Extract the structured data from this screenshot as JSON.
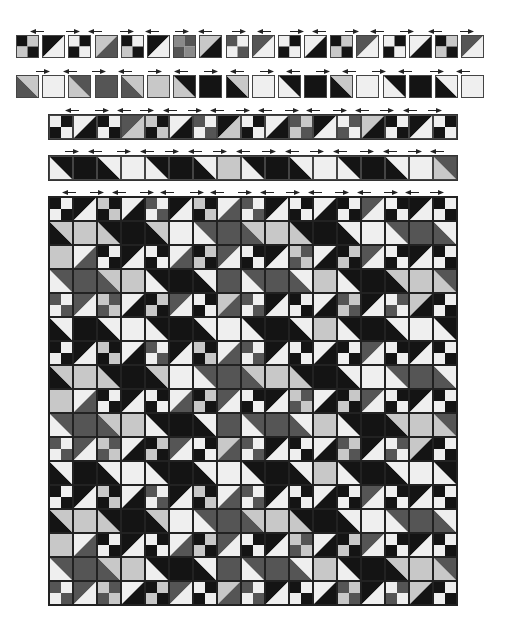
{
  "palette": {
    "K": "#141414",
    "D": "#555555",
    "M": "#8a8a8a",
    "L": "#c8c8c8",
    "W": "#efefef"
  },
  "row1": {
    "tiles": [
      {
        "t": "4p",
        "c": [
          "K",
          "L",
          "L",
          "K"
        ]
      },
      {
        "t": "ta",
        "c": [
          "K",
          "W"
        ]
      },
      {
        "t": "4p",
        "c": [
          "W",
          "K",
          "K",
          "W"
        ]
      },
      {
        "t": "ta",
        "c": [
          "L",
          "D"
        ]
      },
      {
        "t": "4p",
        "c": [
          "K",
          "W",
          "L",
          "K"
        ]
      },
      {
        "t": "ta",
        "c": [
          "K",
          "W"
        ]
      },
      {
        "t": "4p",
        "c": [
          "M",
          "D",
          "D",
          "M"
        ]
      },
      {
        "t": "ta",
        "c": [
          "L",
          "K"
        ]
      },
      {
        "t": "4p",
        "c": [
          "D",
          "W",
          "W",
          "D"
        ]
      },
      {
        "t": "ta",
        "c": [
          "D",
          "W"
        ]
      },
      {
        "t": "4p",
        "c": [
          "W",
          "K",
          "K",
          "W"
        ]
      },
      {
        "t": "ta",
        "c": [
          "W",
          "K"
        ]
      },
      {
        "t": "4p",
        "c": [
          "K",
          "L",
          "L",
          "K"
        ]
      },
      {
        "t": "ta",
        "c": [
          "D",
          "W"
        ]
      },
      {
        "t": "4p",
        "c": [
          "W",
          "K",
          "K",
          "W"
        ]
      },
      {
        "t": "ta",
        "c": [
          "W",
          "K"
        ]
      },
      {
        "t": "4p",
        "c": [
          "K",
          "L",
          "L",
          "K"
        ]
      },
      {
        "t": "ta",
        "c": [
          "D",
          "W"
        ]
      }
    ]
  },
  "row2": {
    "tiles": [
      {
        "t": "tb",
        "c": [
          "D",
          "L"
        ]
      },
      {
        "t": "s",
        "c": [
          "W"
        ]
      },
      {
        "t": "tb",
        "c": [
          "L",
          "D"
        ]
      },
      {
        "t": "s",
        "c": [
          "D"
        ]
      },
      {
        "t": "tb",
        "c": [
          "D",
          "L"
        ]
      },
      {
        "t": "s",
        "c": [
          "L"
        ]
      },
      {
        "t": "tb",
        "c": [
          "L",
          "K"
        ]
      },
      {
        "t": "s",
        "c": [
          "K"
        ]
      },
      {
        "t": "tb",
        "c": [
          "K",
          "L"
        ]
      },
      {
        "t": "s",
        "c": [
          "W"
        ]
      },
      {
        "t": "tb",
        "c": [
          "W",
          "K"
        ]
      },
      {
        "t": "s",
        "c": [
          "K"
        ]
      },
      {
        "t": "tb",
        "c": [
          "K",
          "L"
        ]
      },
      {
        "t": "s",
        "c": [
          "W"
        ]
      },
      {
        "t": "tb",
        "c": [
          "W",
          "K"
        ]
      },
      {
        "t": "s",
        "c": [
          "K"
        ]
      },
      {
        "t": "tb",
        "c": [
          "K",
          "W"
        ]
      },
      {
        "t": "s",
        "c": [
          "W"
        ]
      }
    ]
  },
  "row3": {
    "tiles": [
      {
        "t": "4p",
        "c": [
          "W",
          "K",
          "K",
          "W"
        ]
      },
      {
        "t": "ta",
        "c": [
          "W",
          "K"
        ]
      },
      {
        "t": "4p",
        "c": [
          "K",
          "W",
          "W",
          "K"
        ]
      },
      {
        "t": "ta",
        "c": [
          "D",
          "L"
        ]
      },
      {
        "t": "4p",
        "c": [
          "L",
          "K",
          "K",
          "L"
        ]
      },
      {
        "t": "ta",
        "c": [
          "W",
          "K"
        ]
      },
      {
        "t": "4p",
        "c": [
          "D",
          "W",
          "W",
          "D"
        ]
      },
      {
        "t": "ta",
        "c": [
          "K",
          "L"
        ]
      },
      {
        "t": "4p",
        "c": [
          "W",
          "K",
          "K",
          "W"
        ]
      },
      {
        "t": "ta",
        "c": [
          "W",
          "K"
        ]
      },
      {
        "t": "4p",
        "c": [
          "D",
          "L",
          "L",
          "D"
        ]
      },
      {
        "t": "ta",
        "c": [
          "K",
          "W"
        ]
      },
      {
        "t": "4p",
        "c": [
          "W",
          "D",
          "D",
          "W"
        ]
      },
      {
        "t": "ta",
        "c": [
          "L",
          "K"
        ]
      },
      {
        "t": "4p",
        "c": [
          "K",
          "W",
          "W",
          "K"
        ]
      },
      {
        "t": "ta",
        "c": [
          "K",
          "W"
        ]
      },
      {
        "t": "4p",
        "c": [
          "W",
          "K",
          "K",
          "W"
        ]
      }
    ]
  },
  "row4": {
    "tiles": [
      {
        "t": "tb",
        "c": [
          "W",
          "K"
        ]
      },
      {
        "t": "s",
        "c": [
          "K"
        ]
      },
      {
        "t": "tb",
        "c": [
          "K",
          "W"
        ]
      },
      {
        "t": "s",
        "c": [
          "W"
        ]
      },
      {
        "t": "tb",
        "c": [
          "W",
          "K"
        ]
      },
      {
        "t": "s",
        "c": [
          "K"
        ]
      },
      {
        "t": "tb",
        "c": [
          "K",
          "W"
        ]
      },
      {
        "t": "s",
        "c": [
          "L"
        ]
      },
      {
        "t": "tb",
        "c": [
          "W",
          "K"
        ]
      },
      {
        "t": "s",
        "c": [
          "K"
        ]
      },
      {
        "t": "tb",
        "c": [
          "K",
          "W"
        ]
      },
      {
        "t": "s",
        "c": [
          "W"
        ]
      },
      {
        "t": "tb",
        "c": [
          "W",
          "K"
        ]
      },
      {
        "t": "s",
        "c": [
          "K"
        ]
      },
      {
        "t": "tb",
        "c": [
          "K",
          "W"
        ]
      },
      {
        "t": "s",
        "c": [
          "W"
        ]
      },
      {
        "t": "tb",
        "c": [
          "L",
          "D"
        ]
      }
    ]
  },
  "quilt": {
    "cols": 17,
    "rows": 17,
    "tile_size": 24,
    "odd_row_patterns": [
      [
        [
          "K",
          "W",
          "W",
          "K"
        ],
        [
          "K",
          "W"
        ],
        [
          "L",
          "K",
          "K",
          "L"
        ],
        [
          "W",
          "K"
        ],
        [
          "D",
          "W",
          "W",
          "D"
        ],
        [
          "K",
          "W"
        ],
        [
          "L",
          "K",
          "K",
          "L"
        ],
        [
          "W",
          "D"
        ],
        [
          "D",
          "W",
          "W",
          "D"
        ],
        [
          "K",
          "W"
        ],
        [
          "W",
          "K",
          "K",
          "W"
        ],
        [
          "W",
          "K"
        ],
        [
          "K",
          "W",
          "W",
          "K"
        ],
        [
          "D",
          "W"
        ],
        [
          "W",
          "K",
          "K",
          "W"
        ],
        [
          "K",
          "W"
        ],
        [
          "K",
          "W",
          "W",
          "K"
        ]
      ],
      [
        [
          "L",
          "L",
          "L",
          "L"
        ],
        [
          "W",
          "D"
        ],
        [
          "K",
          "W",
          "W",
          "K"
        ],
        [
          "K",
          "W"
        ],
        [
          "W",
          "K",
          "K",
          "W"
        ],
        [
          "W",
          "D"
        ],
        [
          "K",
          "L",
          "L",
          "K"
        ],
        [
          "D",
          "W"
        ],
        [
          "W",
          "K",
          "K",
          "W"
        ],
        [
          "K",
          "W"
        ],
        [
          "L",
          "D",
          "D",
          "L"
        ],
        [
          "W",
          "K"
        ],
        [
          "K",
          "L",
          "L",
          "K"
        ],
        [
          "D",
          "W"
        ],
        [
          "W",
          "K",
          "K",
          "W"
        ],
        [
          "K",
          "W"
        ],
        [
          "K",
          "W",
          "W",
          "K"
        ]
      ],
      [
        [
          "D",
          "W",
          "W",
          "D"
        ],
        [
          "D",
          "W"
        ],
        [
          "L",
          "D",
          "D",
          "L"
        ],
        [
          "W",
          "K"
        ],
        [
          "K",
          "L",
          "L",
          "K"
        ],
        [
          "D",
          "W"
        ],
        [
          "W",
          "K",
          "K",
          "W"
        ],
        [
          "L",
          "D"
        ],
        [
          "D",
          "W",
          "W",
          "D"
        ],
        [
          "K",
          "W"
        ],
        [
          "K",
          "W",
          "W",
          "K"
        ],
        [
          "W",
          "K"
        ],
        [
          "D",
          "L",
          "L",
          "D"
        ],
        [
          "K",
          "W"
        ],
        [
          "W",
          "D",
          "D",
          "W"
        ],
        [
          "L",
          "K"
        ],
        [
          "K",
          "W",
          "W",
          "K"
        ]
      ]
    ],
    "even_row_patterns": [
      [
        [
          "tb",
          "K",
          "L"
        ],
        [
          "s",
          "L"
        ],
        [
          "tb",
          "L",
          "K"
        ],
        [
          "s",
          "K"
        ],
        [
          "tb",
          "K",
          "L"
        ],
        [
          "s",
          "W"
        ],
        [
          "tb",
          "W",
          "D"
        ],
        [
          "s",
          "D"
        ],
        [
          "tb",
          "D",
          "L"
        ],
        [
          "s",
          "L"
        ],
        [
          "tb",
          "L",
          "K"
        ],
        [
          "s",
          "K"
        ],
        [
          "tb",
          "K",
          "W"
        ],
        [
          "s",
          "W"
        ],
        [
          "tb",
          "W",
          "D"
        ],
        [
          "s",
          "D"
        ],
        [
          "tb",
          "D",
          "W"
        ]
      ],
      [
        [
          "tb",
          "W",
          "D"
        ],
        [
          "s",
          "D"
        ],
        [
          "tb",
          "D",
          "L"
        ],
        [
          "s",
          "L"
        ],
        [
          "tb",
          "W",
          "K"
        ],
        [
          "s",
          "K"
        ],
        [
          "tb",
          "K",
          "W"
        ],
        [
          "s",
          "D"
        ],
        [
          "tb",
          "W",
          "D"
        ],
        [
          "s",
          "D"
        ],
        [
          "tb",
          "D",
          "W"
        ],
        [
          "s",
          "L"
        ],
        [
          "tb",
          "W",
          "K"
        ],
        [
          "s",
          "K"
        ],
        [
          "tb",
          "K",
          "L"
        ],
        [
          "s",
          "L"
        ],
        [
          "tb",
          "L",
          "D"
        ]
      ],
      [
        [
          "tb",
          "K",
          "W"
        ],
        [
          "s",
          "K"
        ],
        [
          "tb",
          "K",
          "W"
        ],
        [
          "s",
          "W"
        ],
        [
          "tb",
          "W",
          "K"
        ],
        [
          "s",
          "K"
        ],
        [
          "tb",
          "K",
          "W"
        ],
        [
          "s",
          "W"
        ],
        [
          "tb",
          "W",
          "K"
        ],
        [
          "s",
          "K"
        ],
        [
          "tb",
          "K",
          "W"
        ],
        [
          "s",
          "L"
        ],
        [
          "tb",
          "W",
          "K"
        ],
        [
          "s",
          "K"
        ],
        [
          "tb",
          "K",
          "W"
        ],
        [
          "s",
          "W"
        ],
        [
          "tb",
          "W",
          "K"
        ]
      ]
    ]
  },
  "arrows": {
    "left": "◄",
    "right": "►"
  }
}
